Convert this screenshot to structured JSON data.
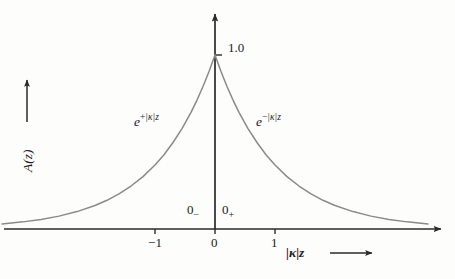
{
  "chart_data": {
    "type": "line",
    "title": "",
    "subtitle": "",
    "xlabel": "|κ|z",
    "ylabel": "A(z)",
    "xlim": [
      -3.55,
      3.8
    ],
    "ylim": [
      0,
      1.12
    ],
    "grid": false,
    "legend_position": "none",
    "axis_style": "arrow-terminated cross axes",
    "xticks": [
      -1,
      0,
      1
    ],
    "xticklabels": [
      "−1",
      "0",
      "1"
    ],
    "yticks": [
      1.0
    ],
    "yticklabels": [
      "1.0"
    ],
    "series": [
      {
        "name": "e^{+|κ|z}",
        "branch": "left",
        "equation": "A(z) = e^{+|κ|z},  z < 0",
        "x": [
          -3.55,
          -3.2,
          -2.9,
          -2.6,
          -2.3,
          -2.0,
          -1.8,
          -1.6,
          -1.4,
          -1.2,
          -1.0,
          -0.85,
          -0.7,
          -0.55,
          -0.4,
          -0.3,
          -0.2,
          -0.1,
          0.0
        ],
        "y": [
          0.029,
          0.041,
          0.055,
          0.074,
          0.1,
          0.135,
          0.165,
          0.202,
          0.247,
          0.301,
          0.368,
          0.427,
          0.497,
          0.577,
          0.67,
          0.741,
          0.819,
          0.905,
          1.0
        ]
      },
      {
        "name": "e^{−|κ|z}",
        "branch": "right",
        "equation": "A(z) = e^{−|κ|z},  z > 0",
        "x": [
          0.0,
          0.1,
          0.2,
          0.3,
          0.4,
          0.55,
          0.7,
          0.85,
          1.0,
          1.2,
          1.4,
          1.6,
          1.8,
          2.0,
          2.3,
          2.6,
          2.9,
          3.2,
          3.55
        ],
        "y": [
          1.0,
          0.905,
          0.819,
          0.741,
          0.67,
          0.577,
          0.497,
          0.427,
          0.368,
          0.301,
          0.247,
          0.202,
          0.165,
          0.135,
          0.1,
          0.074,
          0.055,
          0.041,
          0.029
        ]
      }
    ],
    "annotations": [
      {
        "name": "peak-value",
        "text": "1.0",
        "x": 0.0,
        "y": 1.0
      },
      {
        "name": "left-branch-label",
        "text": "e^{+|κ|z}",
        "x": -1.1,
        "y": 0.62
      },
      {
        "name": "right-branch-label",
        "text": "e^{−|κ|z}",
        "x": 0.85,
        "y": 0.62
      },
      {
        "name": "zero-minus",
        "text": "0−",
        "x": -0.35,
        "y": 0.12
      },
      {
        "name": "zero-plus",
        "text": "0+",
        "x": 0.2,
        "y": 0.12
      }
    ],
    "colors": {
      "background": "#fdfdfb",
      "axis": "#2a2a2a",
      "curve": "#8a8a8a",
      "text": "#1b1b1b"
    }
  },
  "labels": {
    "peak_value": "1.0",
    "tick_minus_one": "−1",
    "tick_zero": "0",
    "tick_one": "1",
    "left_curve_base": "e",
    "left_curve_exp_sign": "+",
    "left_curve_exp_body": "|κ|z",
    "right_curve_base": "e",
    "right_curve_exp_sign": "−",
    "right_curve_exp_body": "|κ|z",
    "zero_minus_base": "0",
    "zero_minus_sub": "−",
    "zero_plus_base": "0",
    "zero_plus_sub": "+",
    "x_axis_title": "|κ|z",
    "y_axis_title": "A(z)"
  }
}
